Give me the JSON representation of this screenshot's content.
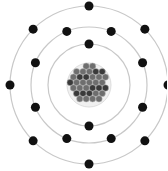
{
  "diagram": {
    "type": "bohr-atom-model",
    "center": [
      89,
      85
    ],
    "colors": {
      "orbit": "#c8c8c8",
      "electron": "#111111",
      "nucleus_fill": "#6e6e6e",
      "nucleon": "#3a3a3a",
      "background": "#ffffff"
    },
    "nucleus": {
      "radius": 22
    },
    "shells": [
      {
        "name": "shell-1",
        "radius": 41,
        "electrons": 2
      },
      {
        "name": "shell-2",
        "radius": 58,
        "electrons": 8
      },
      {
        "name": "shell-3",
        "radius": 79,
        "electrons": 8
      }
    ],
    "electron_radius": 4.5,
    "total_electrons": 18
  }
}
